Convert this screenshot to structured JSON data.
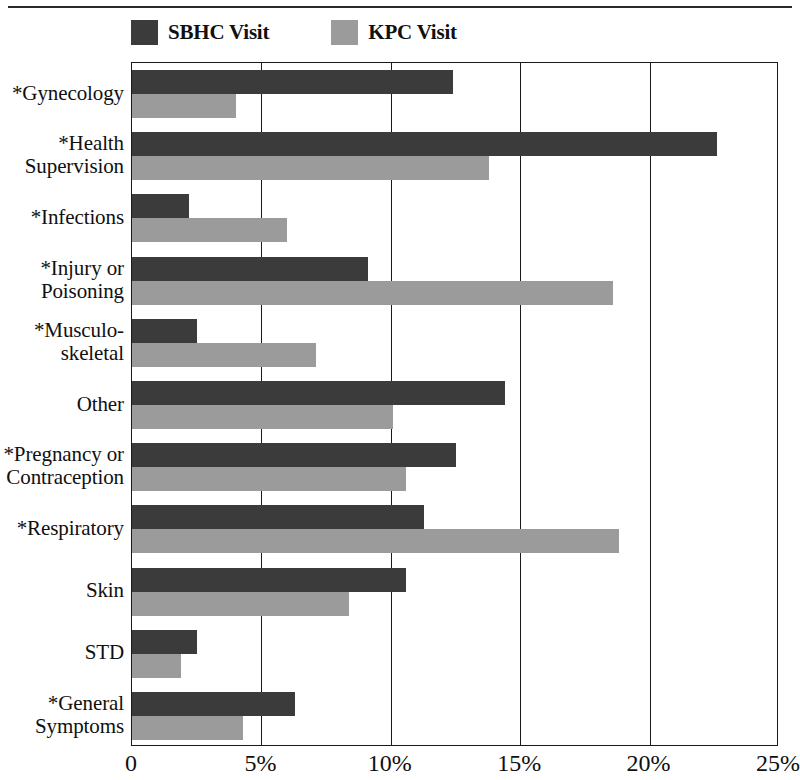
{
  "legend": {
    "entries": [
      {
        "label": "SBHC Visit",
        "color": "#3b3b3b",
        "key": "sbhc"
      },
      {
        "label": "KPC Visit",
        "color": "#9b9b9b",
        "key": "kpc"
      }
    ]
  },
  "axis": {
    "x_ticks": [
      "0",
      "5%",
      "10%",
      "15%",
      "20%",
      "25%"
    ],
    "x_tick_values": [
      0,
      5,
      10,
      15,
      20,
      25
    ],
    "xlim": [
      0,
      25
    ]
  },
  "chart_data": {
    "type": "bar",
    "orientation": "horizontal",
    "title": "",
    "subtitle": "",
    "xlabel": "",
    "ylabel": "",
    "xlim": [
      0,
      25
    ],
    "xticks": [
      0,
      5,
      10,
      15,
      20,
      25
    ],
    "xticklabels": [
      "0",
      "5%",
      "10%",
      "15%",
      "20%",
      "25%"
    ],
    "grid": "vertical",
    "legend_position": "above-plot-left",
    "units": "percent",
    "categories": [
      "*Gynecology",
      "*Health\nSupervision",
      "*Infections",
      "*Injury or\nPoisoning",
      "*Musculo-\nskeletal",
      "Other",
      "*Pregnancy or\nContraception",
      "*Respiratory",
      "Skin",
      "STD",
      "*General\nSymptoms"
    ],
    "series": [
      {
        "name": "SBHC Visit",
        "color": "#3b3b3b",
        "values": [
          12.4,
          22.6,
          2.2,
          9.1,
          2.5,
          14.4,
          12.5,
          11.3,
          10.6,
          2.5,
          6.3
        ]
      },
      {
        "name": "KPC Visit",
        "color": "#9b9b9b",
        "values": [
          4.0,
          13.8,
          6.0,
          18.6,
          7.1,
          10.1,
          10.6,
          18.8,
          8.4,
          1.9,
          4.3
        ]
      }
    ]
  }
}
